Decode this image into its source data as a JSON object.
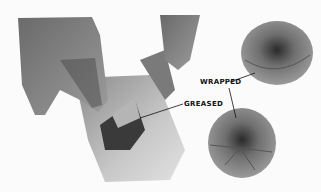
{
  "figure": {
    "labels": {
      "wrapped": "WRAPPED",
      "greased": "GREASED"
    },
    "colors": {
      "background": "#fbfbfb",
      "ink": "#111111"
    }
  }
}
